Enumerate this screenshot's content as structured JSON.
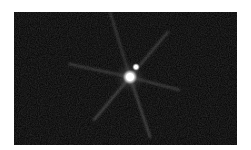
{
  "image": {
    "subject": "bright star with diffraction spikes and faint companion",
    "background_color": "#050505",
    "star_color": "#ffffff",
    "primary_star": {
      "x": 116,
      "y": 65,
      "radius": 7
    },
    "companion_star": {
      "x": 122,
      "y": 55,
      "radius": 3
    }
  }
}
